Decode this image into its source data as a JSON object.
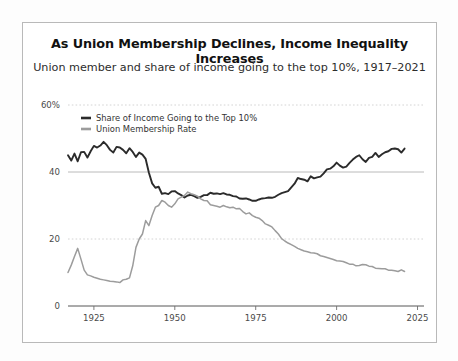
{
  "chart_data": {
    "type": "line",
    "title": "As Union Membership Declines, Income Inequality Increases",
    "subtitle": "Union member and share of income going to the top 10%, 1917–2021",
    "xlabel": "",
    "ylabel": "",
    "xlim": [
      1917,
      2027
    ],
    "ylim": [
      0,
      60
    ],
    "yticks": [
      0,
      20,
      40,
      60
    ],
    "ytick_labels": [
      "0",
      "20",
      "40",
      "60%"
    ],
    "xticks": [
      1925,
      1950,
      1975,
      2000,
      2025
    ],
    "xtick_labels": [
      "1925",
      "1950",
      "1975",
      "2000",
      "2025"
    ],
    "grid": "horizontal-dotted",
    "legend_position": "top-left-inside",
    "colors": {
      "income_share": "#2b2b2b",
      "union_rate": "#9c9c9c",
      "grid": "#c9c9c9",
      "axis": "#6e6e6e",
      "frame": "#b9b9b9"
    },
    "series": [
      {
        "name": "Share of Income Going to the Top 10%",
        "color": "#2b2b2b",
        "x": [
          1917,
          1918,
          1919,
          1920,
          1921,
          1922,
          1923,
          1924,
          1925,
          1926,
          1927,
          1928,
          1929,
          1930,
          1931,
          1932,
          1933,
          1934,
          1935,
          1936,
          1937,
          1938,
          1939,
          1940,
          1941,
          1942,
          1943,
          1944,
          1945,
          1946,
          1947,
          1948,
          1949,
          1950,
          1951,
          1952,
          1953,
          1954,
          1955,
          1956,
          1957,
          1958,
          1959,
          1960,
          1961,
          1962,
          1963,
          1964,
          1965,
          1966,
          1967,
          1968,
          1969,
          1970,
          1971,
          1972,
          1973,
          1974,
          1975,
          1976,
          1977,
          1978,
          1979,
          1980,
          1981,
          1982,
          1983,
          1984,
          1985,
          1986,
          1987,
          1988,
          1989,
          1990,
          1991,
          1992,
          1993,
          1994,
          1995,
          1996,
          1997,
          1998,
          1999,
          2000,
          2001,
          2002,
          2003,
          2004,
          2005,
          2006,
          2007,
          2008,
          2009,
          2010,
          2011,
          2012,
          2013,
          2014,
          2015,
          2016,
          2017,
          2018,
          2019,
          2020,
          2021
        ],
        "values": [
          45.0,
          43.4,
          45.5,
          43.2,
          45.9,
          46.0,
          44.3,
          46.2,
          47.8,
          47.3,
          47.9,
          49.0,
          48.0,
          46.6,
          45.8,
          47.5,
          47.3,
          46.6,
          45.6,
          47.1,
          46.0,
          44.5,
          45.8,
          45.2,
          43.9,
          39.8,
          36.6,
          35.3,
          35.6,
          33.5,
          33.7,
          33.4,
          34.2,
          34.3,
          33.6,
          33.1,
          32.4,
          33.0,
          33.2,
          32.8,
          32.3,
          32.6,
          33.1,
          33.1,
          33.8,
          33.5,
          33.6,
          33.4,
          33.7,
          33.3,
          33.2,
          32.8,
          32.7,
          32.1,
          32.0,
          32.1,
          31.8,
          31.4,
          31.4,
          31.8,
          32.1,
          32.2,
          32.4,
          32.3,
          32.6,
          33.2,
          33.7,
          34.0,
          34.3,
          35.4,
          36.5,
          38.2,
          37.9,
          37.7,
          37.2,
          38.7,
          38.1,
          38.4,
          38.6,
          39.6,
          40.8,
          41.0,
          41.7,
          42.8,
          41.9,
          41.3,
          41.6,
          42.7,
          43.7,
          44.5,
          45.0,
          43.8,
          43.0,
          44.2,
          44.5,
          45.7,
          44.5,
          45.3,
          45.9,
          46.2,
          46.9,
          47.0,
          46.8,
          45.8,
          47.0
        ]
      },
      {
        "name": "Union Membership Rate",
        "color": "#9c9c9c",
        "x": [
          1917,
          1918,
          1919,
          1920,
          1921,
          1922,
          1923,
          1924,
          1925,
          1926,
          1927,
          1928,
          1929,
          1930,
          1931,
          1932,
          1933,
          1934,
          1935,
          1936,
          1937,
          1938,
          1939,
          1940,
          1941,
          1942,
          1943,
          1944,
          1945,
          1946,
          1947,
          1948,
          1949,
          1950,
          1951,
          1952,
          1953,
          1954,
          1955,
          1956,
          1957,
          1958,
          1959,
          1960,
          1961,
          1962,
          1963,
          1964,
          1965,
          1966,
          1967,
          1968,
          1969,
          1970,
          1971,
          1972,
          1973,
          1974,
          1975,
          1976,
          1977,
          1978,
          1979,
          1980,
          1981,
          1982,
          1983,
          1984,
          1985,
          1986,
          1987,
          1988,
          1989,
          1990,
          1991,
          1992,
          1993,
          1994,
          1995,
          1996,
          1997,
          1998,
          1999,
          2000,
          2001,
          2002,
          2003,
          2004,
          2005,
          2006,
          2007,
          2008,
          2009,
          2010,
          2011,
          2012,
          2013,
          2014,
          2015,
          2016,
          2017,
          2018,
          2019,
          2020,
          2021
        ],
        "values": [
          10.0,
          12.2,
          14.8,
          17.2,
          14.0,
          10.7,
          9.3,
          9.0,
          8.6,
          8.3,
          8.0,
          7.8,
          7.6,
          7.4,
          7.3,
          7.2,
          7.0,
          7.8,
          8.0,
          8.4,
          12.0,
          17.5,
          20.0,
          21.5,
          25.5,
          24.0,
          27.0,
          29.5,
          30.0,
          31.5,
          31.0,
          30.0,
          29.5,
          30.5,
          32.0,
          32.5,
          33.0,
          34.0,
          33.5,
          33.2,
          32.8,
          32.0,
          31.5,
          31.4,
          30.2,
          30.0,
          29.8,
          29.5,
          30.0,
          29.6,
          29.3,
          29.5,
          29.0,
          29.1,
          28.2,
          27.5,
          27.8,
          27.0,
          26.5,
          26.2,
          25.5,
          24.5,
          24.1,
          23.6,
          22.5,
          21.5,
          20.1,
          19.4,
          18.8,
          18.3,
          17.8,
          17.2,
          16.8,
          16.4,
          16.2,
          15.9,
          15.8,
          15.6,
          15.0,
          14.8,
          14.5,
          14.2,
          13.9,
          13.5,
          13.4,
          13.3,
          12.9,
          12.5,
          12.5,
          12.0,
          12.1,
          12.4,
          12.3,
          11.9,
          11.8,
          11.3,
          11.2,
          11.1,
          11.1,
          10.7,
          10.7,
          10.5,
          10.3,
          10.8,
          10.3
        ]
      }
    ]
  },
  "legend": {
    "items": [
      {
        "label": "Share of Income Going to the Top 10%"
      },
      {
        "label": "Union Membership Rate"
      }
    ]
  }
}
